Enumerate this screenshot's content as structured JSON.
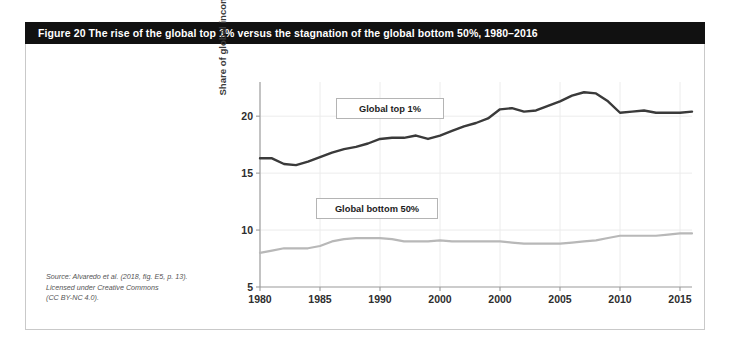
{
  "figure": {
    "title": "Figure 20   The rise of the global top 1% versus the stagnation of the global bottom 50%, 1980–2016",
    "source_lines": [
      "Source: Alvaredo et al. (2018, fig. E5, p. 13).",
      "Licensed under Creative Commons",
      "(CC BY-NC 4.0)."
    ]
  },
  "colors": {
    "title_bar": "#111111",
    "panel_border": "#c9c9c9",
    "series_top": "#3a3a3a",
    "series_bottom": "#b8b8b8",
    "axis": "#9a9a9a",
    "grid": "#ececec"
  },
  "chart_data": {
    "type": "line",
    "title": "The rise of the global top 1% versus the stagnation of the global bottom 50%, 1980–2016",
    "xlabel": "",
    "ylabel": "Share of global income (%)",
    "xlim": [
      1980,
      2016
    ],
    "ylim": [
      5,
      23
    ],
    "ytick_values": [
      5,
      10,
      15,
      20
    ],
    "ytick_labels": [
      "5",
      "10",
      "15",
      "20"
    ],
    "xtick_values": [
      1980,
      1985,
      1990,
      1995,
      2000,
      2005,
      2010,
      2015
    ],
    "xtick_labels": [
      "1980",
      "1985",
      "1990",
      "2000",
      "2000",
      "2005",
      "2010",
      "2015"
    ],
    "grid": true,
    "legend_position": "inside",
    "x": [
      1980,
      1981,
      1982,
      1983,
      1984,
      1985,
      1986,
      1987,
      1988,
      1989,
      1990,
      1991,
      1992,
      1993,
      1994,
      1995,
      1996,
      1997,
      1998,
      1999,
      2000,
      2001,
      2002,
      2003,
      2004,
      2005,
      2006,
      2007,
      2008,
      2009,
      2010,
      2011,
      2012,
      2013,
      2014,
      2015,
      2016
    ],
    "series": [
      {
        "name": "Global top 1%",
        "color": "#3a3a3a",
        "values": [
          16.3,
          16.3,
          15.8,
          15.7,
          16.0,
          16.4,
          16.8,
          17.1,
          17.3,
          17.6,
          18.0,
          18.1,
          18.1,
          18.3,
          18.0,
          18.3,
          18.7,
          19.1,
          19.4,
          19.8,
          20.6,
          20.7,
          20.4,
          20.5,
          20.9,
          21.3,
          21.8,
          22.1,
          22.0,
          21.3,
          20.3,
          20.4,
          20.5,
          20.3,
          20.3,
          20.3,
          20.4
        ]
      },
      {
        "name": "Global bottom 50%",
        "color": "#b8b8b8",
        "values": [
          8.0,
          8.2,
          8.4,
          8.4,
          8.4,
          8.6,
          9.0,
          9.2,
          9.3,
          9.3,
          9.3,
          9.2,
          9.0,
          9.0,
          9.0,
          9.1,
          9.0,
          9.0,
          9.0,
          9.0,
          9.0,
          8.9,
          8.8,
          8.8,
          8.8,
          8.8,
          8.9,
          9.0,
          9.1,
          9.3,
          9.5,
          9.5,
          9.5,
          9.5,
          9.6,
          9.7,
          9.7
        ]
      }
    ]
  },
  "legend": {
    "top": "Global top 1%",
    "bottom": "Global bottom 50%"
  }
}
